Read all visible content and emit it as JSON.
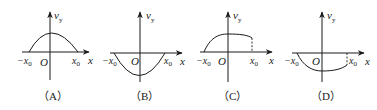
{
  "figure": {
    "axis_labels": {
      "y_main": "v",
      "y_sub": "y",
      "x": "x",
      "origin": "O",
      "neg_x0_main": "−x",
      "pos_x0_main": "x",
      "x0_sub": "0"
    },
    "panels": [
      {
        "id": "A",
        "caption": "（A）",
        "curve": "downward-opening arch above x-axis from −x0 to x0, peak at O",
        "dashed_end_at_x0": false
      },
      {
        "id": "B",
        "caption": "（B）",
        "curve": "upward-opening bowl below x-axis from −x0 to x0, minimum at O",
        "dashed_end_at_x0": false
      },
      {
        "id": "C",
        "caption": "（C）",
        "curve": "rises from 0 at −x0 to a maximum near O, then decreases slightly to a nonzero value at x0",
        "dashed_end_at_x0": true
      },
      {
        "id": "D",
        "caption": "（D）",
        "curve": "falls from 0 at −x0 to a minimum near O, then rises slightly to a nonzero negative value at x0",
        "dashed_end_at_x0": true
      }
    ]
  },
  "colors": {
    "ink": "#1a1a1a",
    "background": "#ffffff"
  }
}
